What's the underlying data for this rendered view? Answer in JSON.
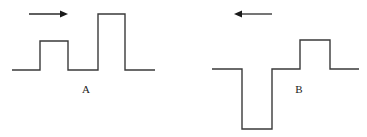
{
  "figure": {
    "panels": [
      {
        "id": "A",
        "label": "A",
        "direction": "right",
        "pulses": [
          {
            "polarity": "positive",
            "relative_height": 1
          },
          {
            "polarity": "positive",
            "relative_height": 2
          }
        ]
      },
      {
        "id": "B",
        "label": "B",
        "direction": "left",
        "pulses": [
          {
            "polarity": "negative",
            "relative_height": 2
          },
          {
            "polarity": "positive",
            "relative_height": 1
          }
        ]
      }
    ],
    "colors": {
      "line": "#3a3a3a",
      "arrow": "#1a1a1a",
      "background": "#ffffff"
    }
  }
}
